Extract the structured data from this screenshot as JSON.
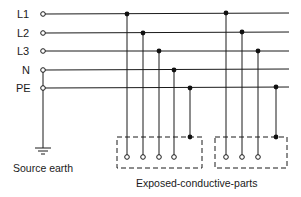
{
  "diagram": {
    "type": "TN-S earthing system",
    "conductors": [
      {
        "label": "L1",
        "y": 14
      },
      {
        "label": "L2",
        "y": 33
      },
      {
        "label": "L3",
        "y": 51
      },
      {
        "label": "N",
        "y": 70
      },
      {
        "label": "PE",
        "y": 88
      }
    ],
    "source_earth_label": "Source earth",
    "exposed_parts_label": "Exposed-conductive-parts",
    "colors": {
      "line": "#1a1a1a",
      "background": "#ffffff"
    }
  }
}
